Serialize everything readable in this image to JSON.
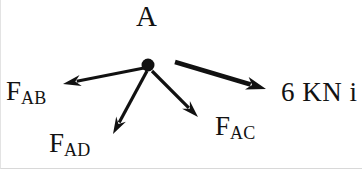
{
  "figure": {
    "type": "free-body-diagram",
    "width": 362,
    "height": 169,
    "background_color": "#ffffff",
    "stroke_color": "#111111"
  },
  "node": {
    "label": "A",
    "center_x": 147,
    "center_y": 65,
    "radius": 6.5
  },
  "labels": {
    "point_a": "A",
    "fab_base": "F",
    "fab_sub": "AB",
    "fad_base": "F",
    "fad_sub": "AD",
    "fac_base": "F",
    "fac_sub": "AC",
    "force_magnitude": "6 KN i"
  },
  "vectors": [
    {
      "name": "F_AB",
      "label": "F",
      "subscript": "AB",
      "from_x": 143,
      "from_y": 68,
      "to_x": 62,
      "to_y": 84,
      "thickness": 3.0,
      "head_length": 18,
      "head_width": 11
    },
    {
      "name": "F_AD",
      "label": "F",
      "subscript": "AD",
      "from_x": 146,
      "from_y": 71,
      "to_x": 112,
      "to_y": 134,
      "thickness": 3.2,
      "head_length": 17,
      "head_width": 11
    },
    {
      "name": "F_AC",
      "label": "F",
      "subscript": "AC",
      "from_x": 151,
      "from_y": 71,
      "to_x": 197,
      "to_y": 117,
      "thickness": 3.2,
      "head_length": 17,
      "head_width": 11
    },
    {
      "name": "applied-force-6kn",
      "label": "6 KN i",
      "subscript": "",
      "from_x": 174,
      "from_y": 62,
      "to_x": 265,
      "to_y": 89,
      "thickness": 4.6,
      "head_length": 20,
      "head_width": 13
    }
  ]
}
